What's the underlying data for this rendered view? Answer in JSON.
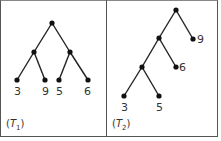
{
  "panels": [
    {
      "id": "T1",
      "caption_letter": "T",
      "caption_sub": "1",
      "leaves": [
        "3",
        "9",
        "5",
        "6"
      ]
    },
    {
      "id": "T2",
      "caption_letter": "T",
      "caption_sub": "2",
      "leaves": [
        "9",
        "6",
        "3",
        "5"
      ]
    }
  ],
  "colors": {
    "line": "#222222",
    "node": "#111111",
    "border": "#555555"
  }
}
